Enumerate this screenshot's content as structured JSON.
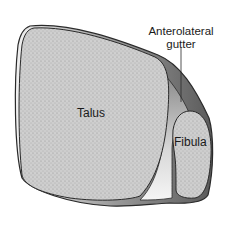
{
  "figure": {
    "labels": {
      "gutter_line1": "Anterolateral",
      "gutter_line2": "gutter",
      "talus": "Talus",
      "fibula": "Fibula"
    },
    "colors": {
      "bone_fill": "#c9c9c9",
      "outline": "#2a2a2a",
      "gutter_shade_dark": "#6e6e6e",
      "gutter_shade_light": "#d8d8d8",
      "background": "#ffffff"
    }
  }
}
